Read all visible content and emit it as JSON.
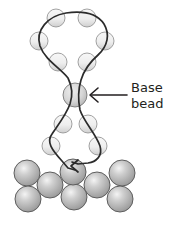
{
  "diagram": {
    "type": "beadwork-illustration",
    "annotation": {
      "line1": "Base",
      "line2": "bead",
      "arrow_target": "base-bead"
    },
    "colors": {
      "thread": "#2b2b2b",
      "bead_fill_light": "#e6e6e6",
      "bead_fill_dark": "#a9a9a9",
      "bead_outline": "#6e6e6e",
      "text": "#231f20"
    },
    "loop_beads": [
      {
        "cx": 56,
        "cy": 18,
        "r": 9
      },
      {
        "cx": 87,
        "cy": 18,
        "r": 9
      },
      {
        "cx": 39,
        "cy": 41,
        "r": 9
      },
      {
        "cx": 105,
        "cy": 41,
        "r": 9
      },
      {
        "cx": 58,
        "cy": 62,
        "r": 9
      },
      {
        "cx": 87,
        "cy": 62,
        "r": 9
      }
    ],
    "base_bead": {
      "cx": 75,
      "cy": 95,
      "r": 12
    },
    "stem_beads": [
      {
        "cx": 63,
        "cy": 124,
        "r": 9
      },
      {
        "cx": 88,
        "cy": 124,
        "r": 9
      },
      {
        "cx": 51,
        "cy": 146,
        "r": 9
      },
      {
        "cx": 98,
        "cy": 146,
        "r": 9
      }
    ],
    "foundation_beads": [
      {
        "cx": 27,
        "cy": 173,
        "r": 13
      },
      {
        "cx": 122,
        "cy": 173,
        "r": 13
      },
      {
        "cx": 50,
        "cy": 185,
        "r": 13
      },
      {
        "cx": 97,
        "cy": 185,
        "r": 13
      },
      {
        "cx": 28,
        "cy": 199,
        "r": 13
      },
      {
        "cx": 120,
        "cy": 199,
        "r": 13
      },
      {
        "cx": 74,
        "cy": 197,
        "r": 13
      },
      {
        "cx": 73,
        "cy": 172,
        "r": 13
      }
    ]
  }
}
